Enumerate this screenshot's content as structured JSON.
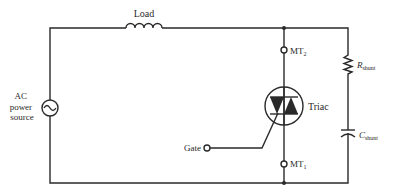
{
  "diagram": {
    "type": "circuit-schematic",
    "title": "",
    "colors": {
      "ink": "#2a2a2a",
      "background": "#ffffff"
    },
    "components": {
      "source": {
        "label_lines": [
          "AC",
          "power",
          "source"
        ],
        "symbol": "ac-source-icon"
      },
      "load": {
        "label": "Load",
        "symbol": "inductor-icon"
      },
      "triac": {
        "label": "Triac",
        "symbol": "triac-icon"
      },
      "mt2": {
        "label": "MT",
        "subscript": "2"
      },
      "mt1": {
        "label": "MT",
        "subscript": "1"
      },
      "gate": {
        "label": "Gate"
      },
      "r_shunt": {
        "label": "R",
        "subscript": "shunt",
        "symbol": "resistor-icon"
      },
      "c_shunt": {
        "label": "C",
        "subscript": "shunt",
        "symbol": "capacitor-icon"
      }
    }
  }
}
